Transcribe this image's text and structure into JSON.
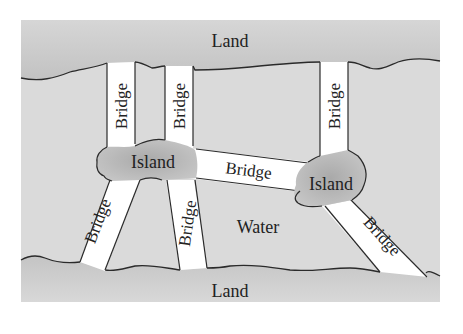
{
  "diagram": {
    "labels": {
      "land_top": "Land",
      "land_bottom": "Land",
      "water": "Water",
      "island_left": "Island",
      "island_right": "Island",
      "bridge": "Bridge"
    },
    "bridges": [
      {
        "id": "top-left",
        "label": "Bridge"
      },
      {
        "id": "top-middle",
        "label": "Bridge"
      },
      {
        "id": "top-right",
        "label": "Bridge"
      },
      {
        "id": "island-to-island",
        "label": "Bridge"
      },
      {
        "id": "bottom-left",
        "label": "Bridge"
      },
      {
        "id": "bottom-middle",
        "label": "Bridge"
      },
      {
        "id": "bottom-right",
        "label": "Bridge"
      }
    ],
    "colors": {
      "land": "#c9c9c9",
      "water": "#dadada",
      "island": "#b8b8b8",
      "bridge": "#ffffff",
      "outline": "#2a2a2a",
      "text": "#222222"
    }
  }
}
